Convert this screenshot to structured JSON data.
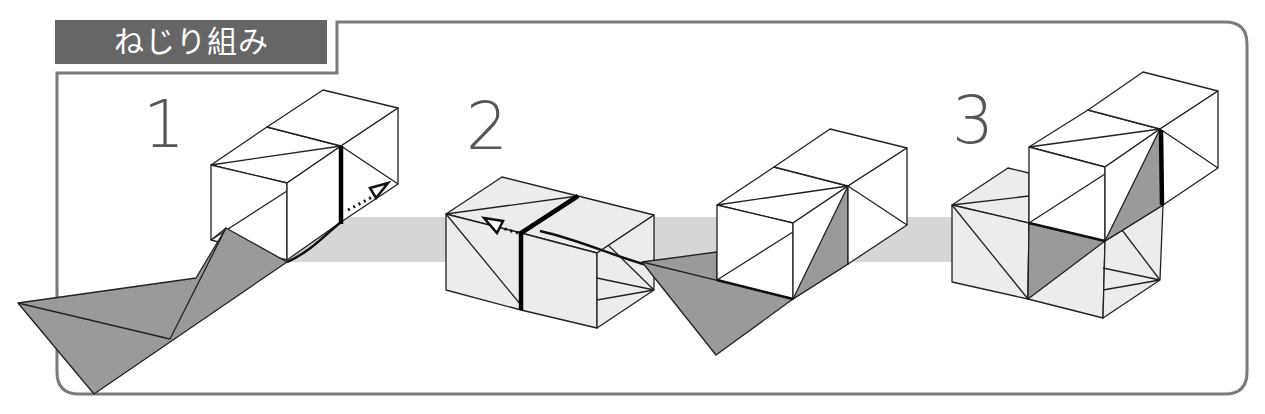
{
  "header": {
    "title": "ねじり組み"
  },
  "steps": [
    {
      "number": "1",
      "label": "step-1"
    },
    {
      "number": "2",
      "label": "step-2"
    },
    {
      "number": "3",
      "label": "step-3"
    }
  ],
  "colors": {
    "header_bg": "#666666",
    "header_text": "#ffffff",
    "frame": "#7a7a7a",
    "band": "#d6d6d6",
    "dark_flap": "#9a9a9a",
    "light_face": "#ececec",
    "step_number": "#555555"
  }
}
